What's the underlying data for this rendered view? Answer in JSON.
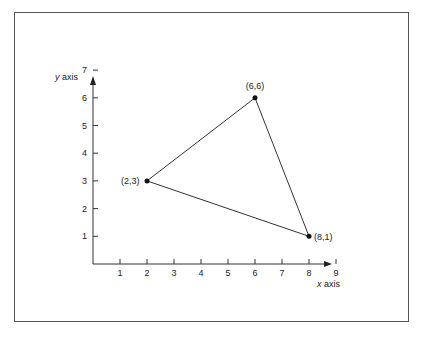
{
  "chart_data": {
    "type": "scatter",
    "title": "",
    "xlabel": "x axis",
    "ylabel": "y axis",
    "xlim": [
      0,
      9
    ],
    "ylim": [
      0,
      7
    ],
    "grid": false,
    "x_ticks": [
      "1",
      "2",
      "3",
      "4",
      "5",
      "6",
      "7",
      "8",
      "9"
    ],
    "y_ticks": [
      "1",
      "2",
      "3",
      "4",
      "5",
      "6",
      "7"
    ],
    "points": [
      {
        "x": 2,
        "y": 3,
        "label": "(2,3)"
      },
      {
        "x": 6,
        "y": 6,
        "label": "(6,6)"
      },
      {
        "x": 8,
        "y": 1,
        "label": "(8,1)"
      }
    ],
    "shape": "triangle connecting (2,3), (6,6), (8,1)"
  }
}
